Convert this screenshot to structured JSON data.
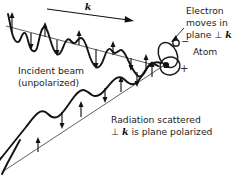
{
  "figure": {
    "background_color": "#ffffff",
    "ink_color": "#121212"
  },
  "labels": {
    "wavevector": "k",
    "incident_beam_line1": "Incident beam",
    "incident_beam_line2": "(unpolarized)",
    "electron_line1": "Electron",
    "electron_line2": "moves in",
    "electron_line3_prefix": "plane ",
    "electron_line3_perp": "⊥ ",
    "electron_line3_k": "k",
    "atom": "Atom",
    "scattered_line1": "Radiation scattered",
    "scattered_line2_perp": "⊥ ",
    "scattered_line2_k": "k",
    "scattered_line2_rest": " is plane polarized",
    "electron_charge_sign": "−",
    "nucleus_charge_sign": "+"
  }
}
